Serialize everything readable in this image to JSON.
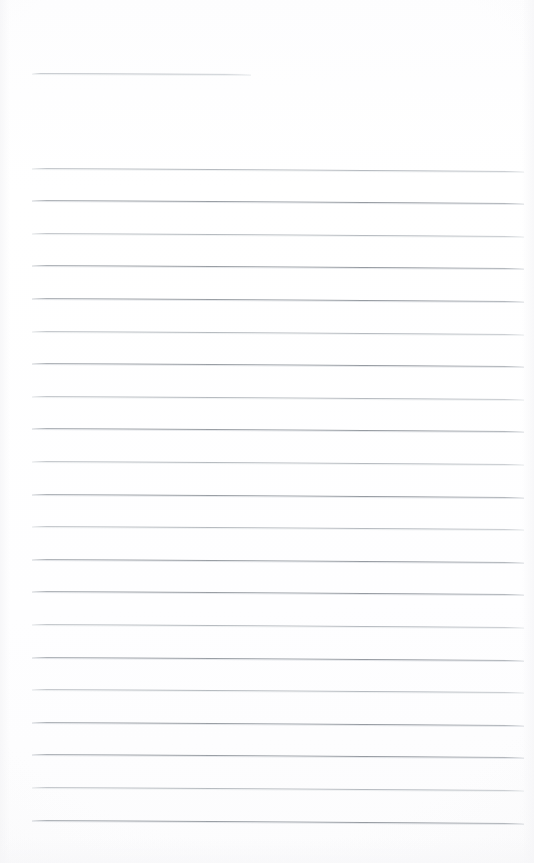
{
  "document": {
    "kind": "scanned-ruled-notepad-page",
    "title": "Blank ruled notepad page",
    "content_text": "",
    "page_width_px": 534,
    "page_height_px": 863,
    "background_color": "#fefefe",
    "is_blank": true,
    "written_content": "none"
  },
  "colors": {
    "page_background": "#fefefe",
    "rule_light": "#b5babf",
    "rule_dark": "#979ca2",
    "header_rule": "#bec2c7"
  },
  "header_rule": {
    "label": "header rule",
    "x_start_px": 32,
    "x_end_px": 251,
    "y_px": 72.5,
    "length_px": 219,
    "slant_px": 1.0,
    "weight": "light"
  },
  "ruling": {
    "label": "ruled writing lines",
    "count": 21,
    "x_start_px": 32,
    "x_end_px": 524,
    "line_length_px": 492,
    "first_line_y_px": 167.5,
    "line_spacing_px": 32.6,
    "last_line_y_px": 820.0,
    "skew_px_across_width": 3.0,
    "stroke_height_px": 1,
    "margin_left_px": 32,
    "margin_right_px": 10,
    "margin_top_px": 167,
    "margin_bottom_px": 40,
    "lines": [
      {
        "index": 1,
        "y": 167.5,
        "weight": "light"
      },
      {
        "index": 2,
        "y": 200.1,
        "weight": "dark"
      },
      {
        "index": 3,
        "y": 232.7,
        "weight": "light"
      },
      {
        "index": 4,
        "y": 265.3,
        "weight": "dark"
      },
      {
        "index": 5,
        "y": 297.9,
        "weight": "dark"
      },
      {
        "index": 6,
        "y": 330.5,
        "weight": "light"
      },
      {
        "index": 7,
        "y": 363.1,
        "weight": "dark"
      },
      {
        "index": 8,
        "y": 395.7,
        "weight": "light"
      },
      {
        "index": 9,
        "y": 428.3,
        "weight": "dark"
      },
      {
        "index": 10,
        "y": 460.9,
        "weight": "light"
      },
      {
        "index": 11,
        "y": 493.5,
        "weight": "dark"
      },
      {
        "index": 12,
        "y": 526.1,
        "weight": "light"
      },
      {
        "index": 13,
        "y": 558.7,
        "weight": "dark"
      },
      {
        "index": 14,
        "y": 591.3,
        "weight": "dark"
      },
      {
        "index": 15,
        "y": 623.9,
        "weight": "light"
      },
      {
        "index": 16,
        "y": 656.5,
        "weight": "dark"
      },
      {
        "index": 17,
        "y": 689.1,
        "weight": "light"
      },
      {
        "index": 18,
        "y": 721.7,
        "weight": "dark"
      },
      {
        "index": 19,
        "y": 754.3,
        "weight": "dark"
      },
      {
        "index": 20,
        "y": 786.9,
        "weight": "light"
      },
      {
        "index": 21,
        "y": 819.5,
        "weight": "dark"
      }
    ]
  }
}
